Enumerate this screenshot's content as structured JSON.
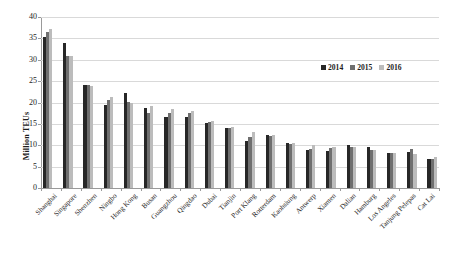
{
  "chart_data": {
    "type": "bar",
    "title": "",
    "xlabel": "",
    "ylabel": "Million TEUs",
    "ylim": [
      0,
      40
    ],
    "yticks": [
      0,
      5,
      10,
      15,
      20,
      25,
      30,
      35,
      40
    ],
    "grid": true,
    "legend_position": "top-right",
    "categories": [
      "Shanghai",
      "Singapore",
      "Shenzhen",
      "Ningbo",
      "Hong Kong",
      "Busan",
      "Guangzhou",
      "Qingdao",
      "Dubai",
      "Tianjin",
      "Port Klang",
      "Rotterdam",
      "Kaohsiung",
      "Antwerp",
      "Xiamen",
      "Dalian",
      "Hamburg",
      "Los Angeles",
      "Tanjung Pelepas",
      "Cat Lai"
    ],
    "series": [
      {
        "name": "2014",
        "color": "#272727",
        "values": [
          35.3,
          33.9,
          24.0,
          19.4,
          22.2,
          18.7,
          16.6,
          16.6,
          15.2,
          14.1,
          10.9,
          12.3,
          10.6,
          9.0,
          8.6,
          10.1,
          9.7,
          8.3,
          8.5,
          6.8
        ]
      },
      {
        "name": "2015",
        "color": "#6f6f6f",
        "values": [
          36.5,
          30.9,
          24.2,
          20.6,
          20.1,
          17.5,
          17.5,
          17.5,
          15.4,
          14.1,
          11.9,
          12.2,
          10.3,
          9.2,
          9.3,
          9.5,
          8.8,
          8.2,
          9.1,
          6.9
        ]
      },
      {
        "name": "2016",
        "color": "#bcbcbc",
        "values": [
          37.1,
          30.9,
          23.9,
          21.4,
          19.8,
          19.2,
          18.5,
          18.0,
          15.7,
          14.3,
          13.0,
          12.3,
          10.5,
          10.0,
          9.6,
          9.6,
          8.9,
          8.2,
          8.0,
          7.3
        ]
      }
    ]
  },
  "legend": {
    "items": [
      {
        "label": "2014"
      },
      {
        "label": "2015"
      },
      {
        "label": "2016"
      }
    ]
  }
}
